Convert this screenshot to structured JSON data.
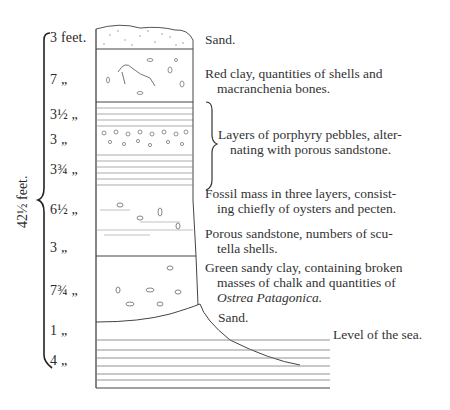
{
  "figure": {
    "total_thickness": "42½ feet.",
    "layers": [
      {
        "thickness": "3 feet.",
        "description": "Sand.",
        "description_cont": ""
      },
      {
        "thickness": "7 „",
        "description": "Red clay, quantities of shells and",
        "description_cont": "macranchenia bones."
      },
      {
        "thickness": "3½ „",
        "description": "",
        "description_cont": ""
      },
      {
        "thickness": "3 „",
        "description": "Layers of porphyry pebbles, alter-",
        "description_cont": "nating with porous sandstone."
      },
      {
        "thickness": "3¾ „",
        "description": "",
        "description_cont": ""
      },
      {
        "thickness": "6½ „",
        "description": "Fossil mass in three layers, consist-",
        "description_cont": "ing chiefly of oysters and pecten."
      },
      {
        "thickness": "3 „",
        "description": "Porous sandstone, numbers of scu-",
        "description_cont": "tella shells."
      },
      {
        "thickness": "7¾ „",
        "description": "Green sandy clay, containing broken",
        "description_cont": "masses of chalk and quantities of",
        "description_italic": "Ostrea Patagonica."
      },
      {
        "thickness": "1 „",
        "description": "Sand.",
        "description_cont": ""
      },
      {
        "thickness": "4 „",
        "description": "",
        "description_cont": ""
      }
    ],
    "sea_level_label": "Level of the sea."
  }
}
